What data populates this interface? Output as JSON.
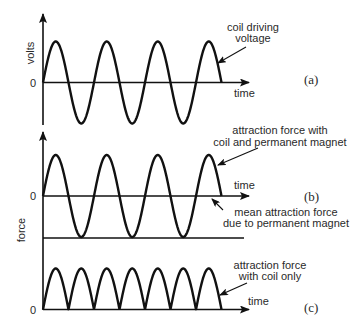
{
  "figure": {
    "panels": [
      {
        "id": "a",
        "tag": "(a)",
        "y_label": "volts",
        "zero_label": "0",
        "x_label": "time",
        "annotation": [
          "coil driving",
          "voltage"
        ],
        "waveform": "sine"
      },
      {
        "id": "b",
        "tag": "(b)",
        "y_label": "force",
        "zero_label": "0",
        "x_label": "time",
        "annotation": [
          "attraction force with",
          "coil and permanent magnet"
        ],
        "annotation_mean": [
          "mean attraction force",
          "due to permanent magnet"
        ],
        "waveform": "sine offset by permanent magnet"
      },
      {
        "id": "c",
        "tag": "(c)",
        "zero_label": "0",
        "x_label": "time",
        "annotation": [
          "attraction force",
          "with coil only"
        ],
        "waveform": "rectified (double frequency)"
      }
    ]
  },
  "waves": {
    "x_start": 43,
    "period_px": 51,
    "cycles": 3.5,
    "amplitude_px": 41,
    "panel_a_baseline": 82.5,
    "panel_b_baseline": 196,
    "panel_c_baseline": 309.5
  },
  "colors": {
    "ink": "#111111",
    "text": "#2a2a2a",
    "background": "#ffffff"
  }
}
